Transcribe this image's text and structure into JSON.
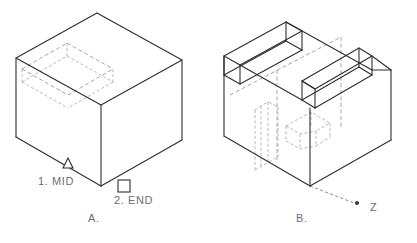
{
  "figure": {
    "width": 417,
    "height": 243,
    "background_color": "#ffffff",
    "line_color": "#3b3b3b",
    "hidden_line_color": "#9a9a9a",
    "text_color": "#6e6e6e"
  },
  "panels": [
    {
      "id": "panel-a",
      "caption": "A.",
      "caption_x": 88,
      "caption_y": 222,
      "description": "Isometric wireframe box with hidden dashed rectangular slot on top face",
      "snap_markers": [
        {
          "name": "midpoint-snap-marker",
          "glyph": "triangle",
          "label": "1.  MID",
          "label_x": 38,
          "label_y": 185,
          "marker_x": 68,
          "marker_y": 160
        },
        {
          "name": "endpoint-snap-marker",
          "glyph": "square",
          "label": "2.  END",
          "label_x": 114,
          "label_y": 204,
          "marker_x": 124,
          "marker_y": 186
        }
      ]
    },
    {
      "id": "panel-b",
      "caption": "B.",
      "caption_x": 296,
      "caption_y": 222,
      "description": "Isometric wireframe box with cut channel pocket and hidden extruded arrow profile",
      "axis_label": {
        "name": "z-axis-label",
        "text": "Z",
        "text_x": 370,
        "text_y": 211,
        "dot_x": 357,
        "dot_y": 203
      }
    }
  ]
}
